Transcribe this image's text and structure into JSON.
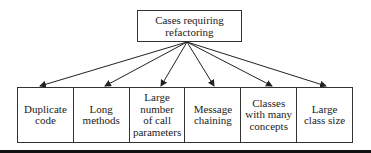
{
  "root": {
    "label_line1": "Cases requiring",
    "label_line2": "refactoring"
  },
  "cases": [
    {
      "line1": "Duplicate",
      "line2": "code"
    },
    {
      "line1": "Long",
      "line2": "methods"
    },
    {
      "line1": "Large",
      "line2": "number",
      "line3": "of call",
      "line4": "parameters"
    },
    {
      "line1": "Message",
      "line2": "chaining"
    },
    {
      "line1": "Classes",
      "line2": "with many",
      "line3": "concepts"
    },
    {
      "line1": "Large",
      "line2": "class size"
    }
  ],
  "colors": {
    "stroke": "#333333",
    "text": "#222222",
    "rule": "#111111"
  }
}
